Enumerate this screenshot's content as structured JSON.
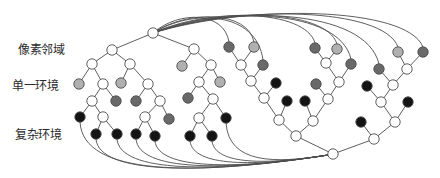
{
  "labels": {
    "pixel_neighborhood": "像素邻域",
    "single_environment": "单一环境",
    "complex_environment": "复杂环境"
  },
  "colors": {
    "background": "#ffffff",
    "stroke": "#4d4d4d",
    "node_fill": {
      "white": "#ffffff",
      "light": "#b0b0b0",
      "dark": "#696969",
      "black": "#141414"
    }
  },
  "diagram": {
    "node_radius": 5.2,
    "nodes": [
      {
        "id": 0,
        "x": 153,
        "y": 33,
        "fill": "white"
      },
      {
        "id": 1,
        "x": 112,
        "y": 50,
        "fill": "white"
      },
      {
        "id": 2,
        "x": 92,
        "y": 64,
        "fill": "white"
      },
      {
        "id": 3,
        "x": 130,
        "y": 64,
        "fill": "white"
      },
      {
        "id": 4,
        "x": 79,
        "y": 84,
        "fill": "light"
      },
      {
        "id": 5,
        "x": 103,
        "y": 84,
        "fill": "white"
      },
      {
        "id": 6,
        "x": 121,
        "y": 83,
        "fill": "light"
      },
      {
        "id": 7,
        "x": 148,
        "y": 84,
        "fill": "white"
      },
      {
        "id": 8,
        "x": 92,
        "y": 101,
        "fill": "white"
      },
      {
        "id": 9,
        "x": 116,
        "y": 101,
        "fill": "dark"
      },
      {
        "id": 10,
        "x": 136,
        "y": 101,
        "fill": "dark"
      },
      {
        "id": 11,
        "x": 160,
        "y": 101,
        "fill": "white"
      },
      {
        "id": 12,
        "x": 80,
        "y": 117,
        "fill": "black"
      },
      {
        "id": 13,
        "x": 103,
        "y": 117,
        "fill": "white"
      },
      {
        "id": 14,
        "x": 145,
        "y": 117,
        "fill": "white"
      },
      {
        "id": 15,
        "x": 169,
        "y": 119,
        "fill": "dark"
      },
      {
        "id": 16,
        "x": 96,
        "y": 134,
        "fill": "black"
      },
      {
        "id": 17,
        "x": 117,
        "y": 134,
        "fill": "black"
      },
      {
        "id": 18,
        "x": 136,
        "y": 134,
        "fill": "black"
      },
      {
        "id": 19,
        "x": 155,
        "y": 136,
        "fill": "black"
      },
      {
        "id": 20,
        "x": 194,
        "y": 49,
        "fill": "white"
      },
      {
        "id": 21,
        "x": 182,
        "y": 66,
        "fill": "light"
      },
      {
        "id": 22,
        "x": 211,
        "y": 65,
        "fill": "white"
      },
      {
        "id": 23,
        "x": 199,
        "y": 82,
        "fill": "white"
      },
      {
        "id": 24,
        "x": 220,
        "y": 82,
        "fill": "light"
      },
      {
        "id": 25,
        "x": 188,
        "y": 98,
        "fill": "dark"
      },
      {
        "id": 26,
        "x": 213,
        "y": 99,
        "fill": "white"
      },
      {
        "id": 27,
        "x": 199,
        "y": 118,
        "fill": "white"
      },
      {
        "id": 28,
        "x": 226,
        "y": 118,
        "fill": "black"
      },
      {
        "id": 29,
        "x": 190,
        "y": 136,
        "fill": "black"
      },
      {
        "id": 30,
        "x": 212,
        "y": 136,
        "fill": "black"
      },
      {
        "id": 31,
        "x": 229,
        "y": 47,
        "fill": "dark"
      },
      {
        "id": 32,
        "x": 254,
        "y": 47,
        "fill": "light"
      },
      {
        "id": 33,
        "x": 241,
        "y": 65,
        "fill": "white"
      },
      {
        "id": 34,
        "x": 263,
        "y": 65,
        "fill": "dark"
      },
      {
        "id": 35,
        "x": 251,
        "y": 81,
        "fill": "white"
      },
      {
        "id": 36,
        "x": 276,
        "y": 83,
        "fill": "black"
      },
      {
        "id": 37,
        "x": 264,
        "y": 98,
        "fill": "white"
      },
      {
        "id": 38,
        "x": 287,
        "y": 101,
        "fill": "black"
      },
      {
        "id": 39,
        "x": 279,
        "y": 120,
        "fill": "white"
      },
      {
        "id": 40,
        "x": 315,
        "y": 48,
        "fill": "dark"
      },
      {
        "id": 41,
        "x": 337,
        "y": 49,
        "fill": "light"
      },
      {
        "id": 42,
        "x": 326,
        "y": 63,
        "fill": "white"
      },
      {
        "id": 43,
        "x": 351,
        "y": 64,
        "fill": "dark"
      },
      {
        "id": 44,
        "x": 339,
        "y": 82,
        "fill": "white"
      },
      {
        "id": 45,
        "x": 316,
        "y": 84,
        "fill": "dark"
      },
      {
        "id": 46,
        "x": 328,
        "y": 99,
        "fill": "white"
      },
      {
        "id": 47,
        "x": 305,
        "y": 101,
        "fill": "black"
      },
      {
        "id": 48,
        "x": 313,
        "y": 121,
        "fill": "white"
      },
      {
        "id": 49,
        "x": 296,
        "y": 136,
        "fill": "white"
      },
      {
        "id": 50,
        "x": 333,
        "y": 154,
        "fill": "white"
      },
      {
        "id": 51,
        "x": 398,
        "y": 52,
        "fill": "light"
      },
      {
        "id": 52,
        "x": 423,
        "y": 52,
        "fill": "dark"
      },
      {
        "id": 53,
        "x": 407,
        "y": 69,
        "fill": "white"
      },
      {
        "id": 54,
        "x": 379,
        "y": 69,
        "fill": "dark"
      },
      {
        "id": 55,
        "x": 393,
        "y": 85,
        "fill": "white"
      },
      {
        "id": 56,
        "x": 367,
        "y": 86,
        "fill": "black"
      },
      {
        "id": 57,
        "x": 381,
        "y": 102,
        "fill": "white"
      },
      {
        "id": 58,
        "x": 408,
        "y": 102,
        "fill": "black"
      },
      {
        "id": 59,
        "x": 395,
        "y": 122,
        "fill": "white"
      },
      {
        "id": 60,
        "x": 361,
        "y": 122,
        "fill": "black"
      },
      {
        "id": 61,
        "x": 374,
        "y": 139,
        "fill": "white"
      }
    ],
    "edges": [
      [
        0,
        1
      ],
      [
        1,
        2
      ],
      [
        1,
        3
      ],
      [
        2,
        4
      ],
      [
        2,
        5
      ],
      [
        3,
        6
      ],
      [
        3,
        7
      ],
      [
        5,
        8
      ],
      [
        5,
        9
      ],
      [
        7,
        10
      ],
      [
        7,
        11
      ],
      [
        8,
        12
      ],
      [
        8,
        13
      ],
      [
        11,
        14
      ],
      [
        11,
        15
      ],
      [
        13,
        16
      ],
      [
        13,
        17
      ],
      [
        14,
        18
      ],
      [
        14,
        19
      ],
      [
        0,
        20
      ],
      [
        20,
        21
      ],
      [
        20,
        22
      ],
      [
        22,
        23
      ],
      [
        22,
        24
      ],
      [
        23,
        25
      ],
      [
        23,
        26
      ],
      [
        26,
        27
      ],
      [
        26,
        28
      ],
      [
        27,
        29
      ],
      [
        27,
        30
      ],
      [
        31,
        33
      ],
      [
        32,
        33
      ],
      [
        33,
        35
      ],
      [
        34,
        35
      ],
      [
        35,
        37
      ],
      [
        36,
        37
      ],
      [
        37,
        39
      ],
      [
        38,
        39
      ],
      [
        39,
        49
      ],
      [
        40,
        42
      ],
      [
        41,
        42
      ],
      [
        42,
        44
      ],
      [
        43,
        44
      ],
      [
        44,
        46
      ],
      [
        45,
        46
      ],
      [
        46,
        48
      ],
      [
        47,
        48
      ],
      [
        48,
        49
      ],
      [
        49,
        50
      ],
      [
        51,
        53
      ],
      [
        52,
        53
      ],
      [
        53,
        55
      ],
      [
        54,
        55
      ],
      [
        55,
        57
      ],
      [
        56,
        57
      ],
      [
        57,
        59
      ],
      [
        58,
        59
      ],
      [
        59,
        61
      ],
      [
        60,
        61
      ],
      [
        61,
        50
      ]
    ],
    "top_curves": {
      "from": 0,
      "to": [
        31,
        32,
        34,
        40,
        41,
        43,
        54,
        51,
        52
      ]
    },
    "bottom_curves": {
      "to": 50,
      "from": [
        12,
        16,
        17,
        18,
        19,
        29,
        30,
        28
      ]
    }
  }
}
